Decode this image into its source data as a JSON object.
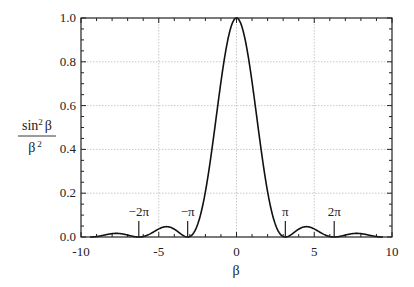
{
  "chart_data": {
    "type": "line",
    "title": "",
    "xlabel": "β",
    "ylabel": "sin² β / β²",
    "ylabel_parts": {
      "numerator": "sin",
      "numerator_sup": "2",
      "numerator_var": "β",
      "denominator": "β",
      "denominator_sup": "2"
    },
    "xlim": [
      -10,
      10
    ],
    "ylim": [
      0.0,
      1.0
    ],
    "x_ticks": [
      -10,
      -5,
      0,
      5,
      10
    ],
    "x_tick_labels": [
      "-10",
      "-5",
      "0",
      "5",
      "10"
    ],
    "y_ticks": [
      0.0,
      0.2,
      0.4,
      0.6,
      0.8,
      1.0
    ],
    "y_tick_labels": [
      "0.0",
      "0.2",
      "0.4",
      "0.6",
      "0.8",
      "1.0"
    ],
    "grid": true,
    "legend": null,
    "series": [
      {
        "name": "sin²(β)/β²",
        "function": "sin(b)^2/b^2",
        "x_range": [
          -9.42,
          9.42
        ],
        "color": "#111111"
      }
    ],
    "sample_points": [
      {
        "x": -9.42,
        "y": 0.0
      },
      {
        "x": -7.73,
        "y": 0.016
      },
      {
        "x": -6.28,
        "y": 0.0
      },
      {
        "x": -4.49,
        "y": 0.047
      },
      {
        "x": -3.14,
        "y": 0.0
      },
      {
        "x": -2.0,
        "y": 0.207
      },
      {
        "x": -1.0,
        "y": 0.708
      },
      {
        "x": 0.0,
        "y": 1.0
      },
      {
        "x": 1.0,
        "y": 0.708
      },
      {
        "x": 2.0,
        "y": 0.207
      },
      {
        "x": 3.14,
        "y": 0.0
      },
      {
        "x": 4.49,
        "y": 0.047
      },
      {
        "x": 6.28,
        "y": 0.0
      },
      {
        "x": 7.73,
        "y": 0.016
      },
      {
        "x": 9.42,
        "y": 0.0
      }
    ],
    "annotations": [
      {
        "label": "−2π",
        "x": -6.283
      },
      {
        "label": "−π",
        "x": -3.1416
      },
      {
        "label": "π",
        "x": 3.1416
      },
      {
        "label": "2π",
        "x": 6.283
      }
    ]
  }
}
